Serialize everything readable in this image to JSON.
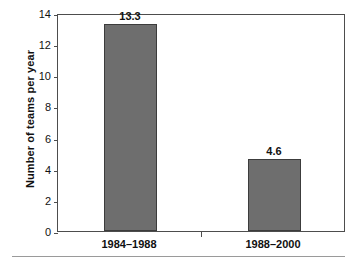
{
  "chart_data": {
    "type": "bar",
    "title": "",
    "xlabel": "",
    "ylabel": "Number of teams per year",
    "categories": [
      "1984–1988",
      "1988–2000"
    ],
    "values": [
      13.3,
      4.6
    ],
    "value_labels": [
      "13.3",
      "4.6"
    ],
    "ylim": [
      0,
      14
    ],
    "yticks": [
      0,
      2,
      4,
      6,
      8,
      10,
      12,
      14
    ],
    "ytick_labels": [
      "0",
      "2",
      "4",
      "6",
      "8",
      "10",
      "12",
      "14"
    ],
    "grid": false,
    "legend": "none",
    "bar_color": "#6e6e6e",
    "bar_edge_color": "#3c3c3c",
    "frame_color": "#4d4d4d",
    "background_color": "#ffffff"
  }
}
